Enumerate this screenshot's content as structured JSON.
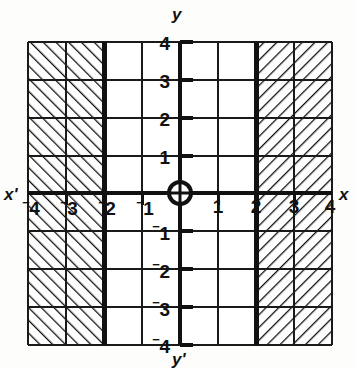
{
  "figure": {
    "kind": "cartesian-graph",
    "background": "#fdfdfb",
    "ink": "#111111"
  },
  "axis_names": {
    "x_positive": "x",
    "x_negative": "x'",
    "y_positive": "y",
    "y_negative": "y'"
  },
  "origin_marker": "circled-cross",
  "chart_data": {
    "type": "line",
    "title": "",
    "xlabel": "x",
    "ylabel": "y",
    "xlim": [
      -4,
      4
    ],
    "ylim": [
      -4,
      4
    ],
    "grid": true,
    "grid_step": 1,
    "legend": "none",
    "x_ticks": [
      -4,
      -3,
      -2,
      -1,
      1,
      2,
      3,
      4
    ],
    "y_ticks": [
      4,
      3,
      2,
      1,
      -1,
      -2,
      -3,
      -4
    ],
    "x_tick_labels": [
      "⁻4",
      "⁻3",
      "⁻2",
      "⁻1",
      "1",
      "2",
      "3",
      "4"
    ],
    "y_tick_labels": [
      "4",
      "3",
      "2",
      "1",
      "⁻1",
      "⁻2",
      "⁻3",
      "⁻4"
    ],
    "series": [
      {
        "name": "boundary x = -2",
        "type": "vertical-line",
        "value": -2,
        "style": "thick-solid",
        "included": true
      },
      {
        "name": "boundary x = 2",
        "type": "vertical-line",
        "value": 2,
        "style": "thick-solid",
        "included": true
      }
    ],
    "shaded_regions": [
      {
        "name": "left-region",
        "description": "x ≤ ⁻2",
        "x_range": [
          -4,
          -2
        ],
        "y_range": [
          -4,
          4
        ],
        "hatch": "forward-slash",
        "hatch_angle_deg": 45
      },
      {
        "name": "right-region",
        "description": "x ≥ 2",
        "x_range": [
          2,
          4
        ],
        "y_range": [
          -4,
          4
        ],
        "hatch": "back-slash",
        "hatch_angle_deg": -45
      }
    ],
    "annotations": []
  }
}
